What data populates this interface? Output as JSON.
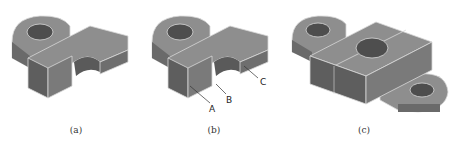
{
  "figures": [
    {
      "id": "a",
      "caption": "(a)",
      "labels": []
    },
    {
      "id": "b",
      "caption": "(b)",
      "labels": [
        "A",
        "B",
        "C"
      ]
    },
    {
      "id": "c",
      "caption": "(c)",
      "labels": []
    }
  ],
  "colors": {
    "top": "#8e8e8e",
    "side_light": "#7a7a7a",
    "side_dark": "#5e5e5e",
    "edge": "#d8d8d8",
    "hole": "#4e4e4e"
  }
}
